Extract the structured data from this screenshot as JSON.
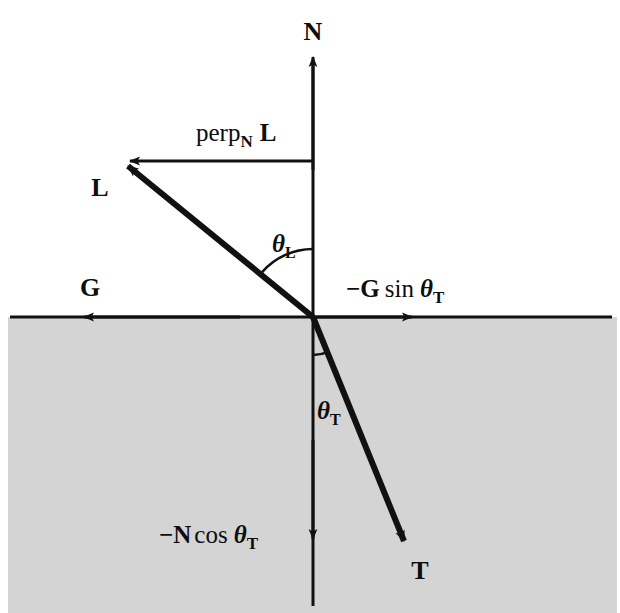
{
  "figure": {
    "background_color": "#ffffff",
    "medium_fill_color": "#d4d4d4",
    "stroke_color": "#111111"
  },
  "labels": {
    "normal_vector": "N",
    "light_vector": "L",
    "transmitted_vector": "T",
    "surface_tangent_vector": "G",
    "perp_component": {
      "func": "perp",
      "sub": "N",
      "vector": "L"
    },
    "g_sin_term": {
      "sign": "−",
      "vector": "G",
      "func": "sin",
      "theta": "θ",
      "sub": "T"
    },
    "n_cos_term": {
      "sign": "−",
      "vector": "N",
      "func": "cos",
      "theta": "θ",
      "sub": "T"
    },
    "theta_incident": {
      "theta": "θ",
      "sub": "L"
    },
    "theta_transmitted": {
      "theta": "θ",
      "sub": "T"
    }
  },
  "geometry": {
    "origin": {
      "x": 313,
      "y": 317
    },
    "surface_line": {
      "x1": 10,
      "y1": 317,
      "x2": 612,
      "y2": 317
    },
    "normal_axis": {
      "x": 313,
      "top_tip_y": 55,
      "bottom_end_y": 606
    },
    "n_cos_arrow_tip": {
      "x": 313,
      "y": 541
    },
    "light_vector_tip": {
      "x": 122,
      "y": 161
    },
    "transmitted_vector_tip": {
      "x": 409,
      "y": 548
    },
    "perp_line": {
      "x1": 122,
      "y1": 161,
      "x2": 313,
      "y2": 161
    },
    "g_arrow_tip": {
      "x": 82,
      "y": 317
    },
    "g_sin_arrow_tip": {
      "x": 414,
      "y": 317
    },
    "theta_incident_arc_radius": 68,
    "theta_transmitted_arc_radius": 38,
    "medium_rect": {
      "x": 8,
      "y": 317,
      "width": 609,
      "height": 296
    }
  },
  "label_positions": {
    "normal_vector": {
      "x": 313,
      "y": 40
    },
    "light_vector": {
      "x": 100,
      "y": 196
    },
    "transmitted_vector": {
      "x": 420,
      "y": 579
    },
    "surface_tangent_vector": {
      "x": 90,
      "y": 296
    },
    "perp_component": {
      "x": 196,
      "y": 141
    },
    "g_sin_term": {
      "x": 346,
      "y": 297
    },
    "n_cos_term": {
      "x": 159,
      "y": 543
    },
    "theta_incident": {
      "x": 272,
      "y": 252
    },
    "theta_transmitted": {
      "x": 317,
      "y": 419
    }
  }
}
